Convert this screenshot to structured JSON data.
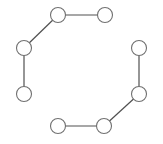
{
  "diagram": {
    "type": "graph",
    "style": {
      "node_radius": 7.5,
      "node_fill": "#ffffff",
      "node_stroke": "#707070",
      "edge_stroke": "#505050",
      "edge_width": 1.2
    },
    "nodes": [
      {
        "id": "n1",
        "x": 58,
        "y": 15
      },
      {
        "id": "n2",
        "x": 105,
        "y": 15
      },
      {
        "id": "n3",
        "x": 24,
        "y": 48
      },
      {
        "id": "n4",
        "x": 24,
        "y": 94
      },
      {
        "id": "n5",
        "x": 139,
        "y": 48
      },
      {
        "id": "n6",
        "x": 139,
        "y": 94
      },
      {
        "id": "n7",
        "x": 104,
        "y": 126
      },
      {
        "id": "n8",
        "x": 58,
        "y": 126
      }
    ],
    "edges": [
      {
        "from": "n2",
        "to": "n1"
      },
      {
        "from": "n1",
        "to": "n3"
      },
      {
        "from": "n3",
        "to": "n4"
      },
      {
        "from": "n5",
        "to": "n6"
      },
      {
        "from": "n6",
        "to": "n7"
      },
      {
        "from": "n7",
        "to": "n8"
      }
    ]
  }
}
